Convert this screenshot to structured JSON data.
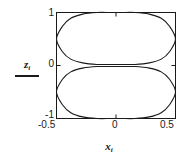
{
  "chart_data": {
    "type": "line",
    "title": "",
    "xlabel": "x",
    "xlabel_sub": "i",
    "ylabel": "z",
    "ylabel_sub": "i",
    "xlim": [
      -0.5,
      0.5
    ],
    "ylim": [
      -1,
      1
    ],
    "xticks": [
      -0.5,
      0,
      0.5
    ],
    "xtick_labels": [
      "-0.5",
      "0",
      "0.5"
    ],
    "yticks": [
      -1,
      0,
      1
    ],
    "ytick_labels": [
      "-1",
      "0",
      "1"
    ],
    "grid": false,
    "legend": null,
    "frame": true,
    "tick_direction": "in",
    "line_color": "#1a1a1a",
    "background_color": "#ffffff",
    "series": [
      {
        "name": "upper-lobe",
        "comment": "closed ellipse-like lobe spanning x in [-0.5,0.5], z from about 0.04 to 1.0",
        "x": [
          -0.5,
          -0.45,
          -0.38,
          -0.28,
          -0.16,
          -0.05,
          0.0,
          0.05,
          0.16,
          0.28,
          0.38,
          0.45,
          0.5,
          0.45,
          0.38,
          0.28,
          0.16,
          0.05,
          0.0,
          -0.05,
          -0.16,
          -0.28,
          -0.38,
          -0.45,
          -0.5
        ],
        "z": [
          0.5,
          0.74,
          0.89,
          0.97,
          1.0,
          1.0,
          1.0,
          1.0,
          1.0,
          0.97,
          0.89,
          0.74,
          0.5,
          0.26,
          0.12,
          0.05,
          0.02,
          0.02,
          0.02,
          0.02,
          0.02,
          0.05,
          0.12,
          0.26,
          0.5
        ]
      },
      {
        "name": "lower-lobe",
        "comment": "mirror image of the upper lobe below z=0",
        "x": [
          -0.5,
          -0.45,
          -0.38,
          -0.28,
          -0.16,
          -0.05,
          0.0,
          0.05,
          0.16,
          0.28,
          0.38,
          0.45,
          0.5,
          0.45,
          0.38,
          0.28,
          0.16,
          0.05,
          0.0,
          -0.05,
          -0.16,
          -0.28,
          -0.38,
          -0.45,
          -0.5
        ],
        "z": [
          -0.5,
          -0.74,
          -0.89,
          -0.97,
          -1.0,
          -1.0,
          -1.0,
          -1.0,
          -1.0,
          -0.97,
          -0.89,
          -0.74,
          -0.5,
          -0.26,
          -0.12,
          -0.05,
          -0.02,
          -0.02,
          -0.02,
          -0.02,
          -0.02,
          -0.05,
          -0.12,
          -0.26,
          -0.5
        ]
      }
    ]
  }
}
